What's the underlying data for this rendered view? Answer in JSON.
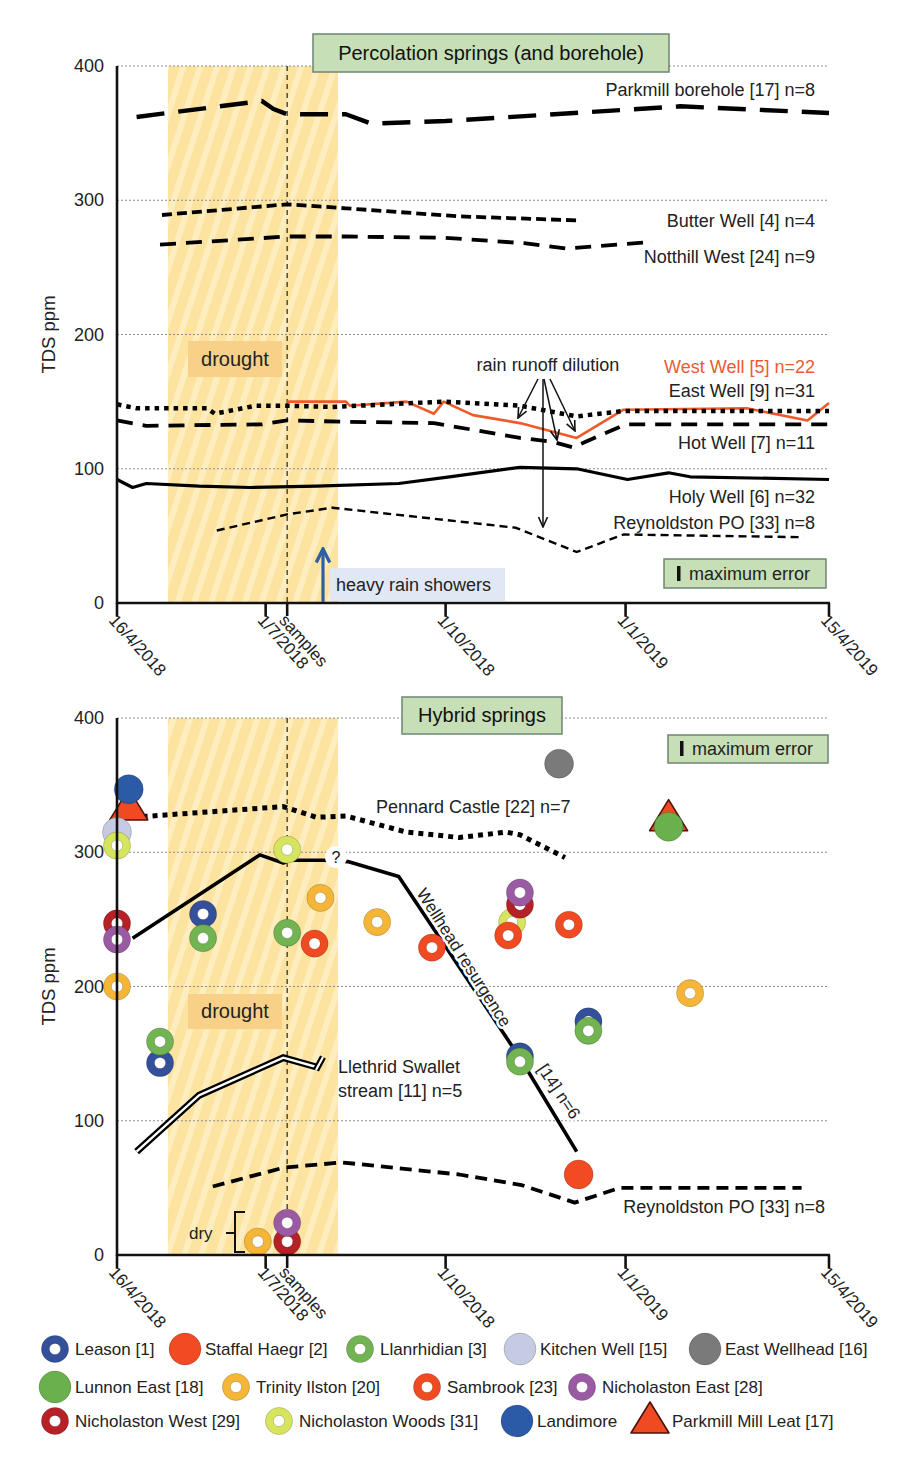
{
  "chart_data": [
    {
      "type": "line",
      "title": "Percolation springs (and borehole)",
      "xlabel": "",
      "ylabel": "TDS ppm",
      "ylim": [
        0,
        400
      ],
      "yticks": [
        0,
        100,
        200,
        300,
        400
      ],
      "xlim": [
        "2018-04-16",
        "2019-04-15"
      ],
      "xticks": [
        {
          "date": "2018-04-16",
          "label": "16/4/2018"
        },
        {
          "date": "2018-07-01",
          "label": "1/7/2018"
        },
        {
          "date": "2018-07-12",
          "label": "samples"
        },
        {
          "date": "2018-10-01",
          "label": "1/10/2018"
        },
        {
          "date": "2019-01-01",
          "label": "1/1/2019"
        },
        {
          "date": "2019-04-15",
          "label": "15/4/2019"
        }
      ],
      "grid": {
        "horizontal": true,
        "vertical": false,
        "style": "dotted"
      },
      "legend_position": "inline labels at right",
      "shaded_regions": [
        {
          "label": "drought",
          "from": "2018-05-12",
          "to": "2018-08-07",
          "color": "#fde4a0"
        }
      ],
      "vlines": [
        {
          "date": "2018-07-12",
          "label": "samples"
        }
      ],
      "series": [
        {
          "name": "Parkmill borehole [17] n=8",
          "style": "long-dash",
          "color": "#000000",
          "points": [
            [
              "2018-04-26",
              362
            ],
            [
              "2018-06-29",
              374
            ],
            [
              "2018-07-05",
              368
            ],
            [
              "2018-07-12",
              364
            ],
            [
              "2018-08-11",
              364
            ],
            [
              "2018-08-24",
              357
            ],
            [
              "2018-10-01",
              359
            ],
            [
              "2019-01-29",
              370
            ],
            [
              "2019-04-15",
              365
            ]
          ]
        },
        {
          "name": "Butter Well [4] n=4",
          "style": "short-dash",
          "color": "#000000",
          "points": [
            [
              "2018-05-09",
              289
            ],
            [
              "2018-07-12",
              297
            ],
            [
              "2018-08-11",
              294
            ],
            [
              "2018-10-08",
              288
            ],
            [
              "2018-12-08",
              285
            ]
          ]
        },
        {
          "name": "Notthill West [24] n=9",
          "style": "dash",
          "color": "#000000",
          "points": [
            [
              "2018-05-08",
              267
            ],
            [
              "2018-07-12",
              273
            ],
            [
              "2018-08-11",
              273
            ],
            [
              "2018-10-01",
              272
            ],
            [
              "2018-11-10",
              268
            ],
            [
              "2018-12-02",
              264
            ],
            [
              "2019-01-15",
              269
            ]
          ]
        },
        {
          "name": "West Well [5] n=22",
          "style": "solid-thin",
          "color": "#f05a28",
          "points": [
            [
              "2018-07-12",
              150
            ],
            [
              "2018-08-11",
              150
            ],
            [
              "2018-08-13",
              147
            ],
            [
              "2018-09-11",
              150
            ],
            [
              "2018-09-25",
              141
            ],
            [
              "2018-09-30",
              150
            ],
            [
              "2018-10-15",
              140
            ],
            [
              "2018-11-08",
              134
            ],
            [
              "2018-12-07",
              123
            ],
            [
              "2018-12-31",
              144
            ],
            [
              "2019-03-04",
              145
            ],
            [
              "2019-04-04",
              136
            ],
            [
              "2019-04-15",
              149
            ]
          ]
        },
        {
          "name": "East Well [9] n=31",
          "style": "dotted",
          "color": "#000000",
          "points": [
            [
              "2018-04-16",
              148
            ],
            [
              "2018-04-26",
              145
            ],
            [
              "2018-06-01",
              145
            ],
            [
              "2018-06-05",
              141
            ],
            [
              "2018-06-26",
              147
            ],
            [
              "2018-07-12",
              147
            ],
            [
              "2018-08-04",
              146
            ],
            [
              "2018-09-30",
              150
            ],
            [
              "2018-11-08",
              147
            ],
            [
              "2018-12-07",
              139
            ],
            [
              "2018-12-31",
              143
            ],
            [
              "2019-04-15",
              143
            ]
          ]
        },
        {
          "name": "Hot Well [7] n=11",
          "style": "dash",
          "color": "#000000",
          "points": [
            [
              "2018-04-16",
              136
            ],
            [
              "2018-05-01",
              132
            ],
            [
              "2018-06-29",
              133
            ],
            [
              "2018-07-12",
              136
            ],
            [
              "2018-08-13",
              135
            ],
            [
              "2018-09-25",
              134
            ],
            [
              "2018-11-08",
              123
            ],
            [
              "2018-11-25",
              120
            ],
            [
              "2018-12-05",
              116
            ],
            [
              "2019-01-01",
              133
            ],
            [
              "2019-04-15",
              133
            ]
          ]
        },
        {
          "name": "Holy Well [6] n=32",
          "style": "solid",
          "color": "#000000",
          "points": [
            [
              "2018-04-16",
              92
            ],
            [
              "2018-04-24",
              86
            ],
            [
              "2018-05-01",
              89
            ],
            [
              "2018-05-28",
              87
            ],
            [
              "2018-06-23",
              86
            ],
            [
              "2018-07-27",
              87
            ],
            [
              "2018-09-07",
              89
            ],
            [
              "2018-10-03",
              94
            ],
            [
              "2018-11-08",
              101
            ],
            [
              "2018-12-07",
              100
            ],
            [
              "2019-01-02",
              92
            ],
            [
              "2019-01-23",
              97
            ],
            [
              "2019-02-03",
              94
            ],
            [
              "2019-04-15",
              92
            ]
          ]
        },
        {
          "name": "Reynoldston PO [33] n=8",
          "style": "fine-dash",
          "color": "#000000",
          "points": [
            [
              "2018-06-06",
              54
            ],
            [
              "2018-07-12",
              66
            ],
            [
              "2018-08-04",
              71
            ],
            [
              "2018-09-30",
              62
            ],
            [
              "2018-11-06",
              56
            ],
            [
              "2018-12-07",
              38
            ],
            [
              "2018-12-31",
              51
            ],
            [
              "2019-04-02",
              49
            ]
          ]
        }
      ],
      "annotations": [
        {
          "text": "drought"
        },
        {
          "text": "rain runoff dilution",
          "arrow_count": 4
        },
        {
          "text": "heavy rain showers",
          "date": "2018-07-30",
          "color": "#2e5fa3"
        },
        {
          "text": "maximum error"
        }
      ]
    },
    {
      "type": "line+scatter",
      "title": "Hybrid springs",
      "xlabel": "",
      "ylabel": "TDS ppm",
      "ylim": [
        0,
        400
      ],
      "yticks": [
        0,
        100,
        200,
        300,
        400
      ],
      "xlim": [
        "2018-04-16",
        "2019-04-15"
      ],
      "xticks": [
        {
          "date": "2018-04-16",
          "label": "16/4/2018"
        },
        {
          "date": "2018-07-01",
          "label": "1/7/2018"
        },
        {
          "date": "2018-07-12",
          "label": "samples"
        },
        {
          "date": "2018-10-01",
          "label": "1/10/2018"
        },
        {
          "date": "2019-01-01",
          "label": "1/1/2019"
        },
        {
          "date": "2019-04-15",
          "label": "15/4/2019"
        }
      ],
      "grid": {
        "horizontal": true,
        "vertical": false,
        "style": "dotted"
      },
      "legend_position": "bottom",
      "shaded_regions": [
        {
          "label": "drought",
          "from": "2018-05-12",
          "to": "2018-08-07",
          "color": "#fde4a0"
        }
      ],
      "vlines": [
        {
          "date": "2018-07-12",
          "label": "samples"
        }
      ],
      "series": [
        {
          "name": "Pennard Castle [22] n=7",
          "style": "dotted-thick",
          "color": "#000000",
          "points": [
            [
              "2018-04-24",
              326
            ],
            [
              "2018-07-10",
              334
            ],
            [
              "2018-07-27",
              326
            ],
            [
              "2018-08-11",
              327
            ],
            [
              "2018-09-11",
              315
            ],
            [
              "2018-10-08",
              311
            ],
            [
              "2018-11-01",
              315
            ],
            [
              "2018-11-08",
              313
            ],
            [
              "2018-11-23",
              302
            ],
            [
              "2018-12-01",
              296
            ]
          ]
        },
        {
          "name": "Wellhead resurgence [14] n=6",
          "label_parts": [
            "Wellhead resurgence",
            "[14] n=6"
          ],
          "style": "solid-thick",
          "color": "#000000",
          "points": [
            [
              "2018-04-24",
              236
            ],
            [
              "2018-06-28",
              298
            ],
            [
              "2018-07-10",
              292
            ],
            [
              "2018-07-13",
              294
            ],
            [
              "2018-07-31",
              294
            ],
            [
              "2018-08-12",
              293
            ],
            [
              "2018-09-07",
              282
            ],
            [
              "2018-11-08",
              147
            ],
            [
              "2018-12-07",
              77
            ]
          ]
        },
        {
          "name": "Llethrid Swallet stream [11] n=5",
          "label_parts": [
            "Llethrid Swallet",
            "stream [11] n=5"
          ],
          "style": "double",
          "color": "#000000",
          "points": [
            [
              "2018-04-26",
              77
            ],
            [
              "2018-05-28",
              119
            ],
            [
              "2018-07-10",
              147
            ],
            [
              "2018-07-27",
              140
            ]
          ]
        },
        {
          "name": "Reynoldston PO [33] n=8",
          "style": "dash-med",
          "color": "#000000",
          "points": [
            [
              "2018-06-04",
              51
            ],
            [
              "2018-07-10",
              65
            ],
            [
              "2018-08-09",
              69
            ],
            [
              "2018-10-08",
              60
            ],
            [
              "2018-11-09",
              52
            ],
            [
              "2018-12-06",
              39
            ],
            [
              "2018-12-29",
              50
            ],
            [
              "2019-04-01",
              50
            ]
          ]
        }
      ],
      "scatter": [
        {
          "name": "Parkmill Mill Leat [17]",
          "marker": "triangle",
          "color": "#f04a23",
          "points": [
            [
              "2018-04-22",
              333
            ],
            [
              "2019-01-23",
              325
            ]
          ]
        },
        {
          "name": "Kitchen Well [15]",
          "marker": "filled",
          "color": "#c4cbe3",
          "points": [
            [
              "2018-04-16",
              315
            ]
          ]
        },
        {
          "name": "East Wellhead [16]",
          "marker": "filled",
          "color": "#7a7a7a",
          "points": [
            [
              "2018-11-28",
              366
            ]
          ]
        },
        {
          "name": "Landimore",
          "marker": "filled",
          "color": "#2b5aa7",
          "points": [
            [
              "2018-04-22",
              347
            ]
          ]
        },
        {
          "name": "Lunnon East [18]",
          "marker": "filled",
          "color": "#6ab04c",
          "points": [
            [
              "2019-01-23",
              319
            ]
          ]
        },
        {
          "name": "Staffal Haegr [2]",
          "marker": "filled",
          "color": "#f24b24",
          "points": [
            [
              "2018-12-08",
              60
            ]
          ]
        },
        {
          "name": "Trinity Ilston [20]",
          "marker": "ring",
          "color": "#f5b638",
          "points": [
            [
              "2018-04-16",
              200
            ],
            [
              "2018-07-29",
              266
            ],
            [
              "2018-08-27",
              248
            ],
            [
              "2019-02-03",
              195
            ],
            [
              "2018-06-27",
              10
            ]
          ]
        },
        {
          "name": "Nicholaston Woods [31]",
          "marker": "ring",
          "color": "#d6e45e",
          "points": [
            [
              "2018-04-16",
              305
            ],
            [
              "2018-07-12",
              302
            ],
            [
              "2018-11-04",
              248
            ]
          ]
        },
        {
          "name": "Sambrook [23]",
          "marker": "ring",
          "color": "#f04a23",
          "points": [
            [
              "2018-07-26",
              232
            ],
            [
              "2018-09-24",
              229
            ],
            [
              "2018-11-02",
              238
            ],
            [
              "2018-12-03",
              246
            ]
          ]
        },
        {
          "name": "Leason [1]",
          "marker": "ring",
          "color": "#34509a",
          "points": [
            [
              "2018-05-08",
              143
            ],
            [
              "2018-05-30",
              254
            ],
            [
              "2018-11-08",
              148
            ],
            [
              "2018-12-13",
              174
            ]
          ]
        },
        {
          "name": "Llanrhidian [3]",
          "marker": "ring",
          "color": "#72b352",
          "points": [
            [
              "2018-05-08",
              159
            ],
            [
              "2018-05-30",
              236
            ],
            [
              "2018-07-12",
              240
            ],
            [
              "2018-11-08",
              144
            ],
            [
              "2018-12-13",
              167
            ]
          ]
        },
        {
          "name": "Nicholaston West [29]",
          "marker": "ring",
          "color": "#b52126",
          "points": [
            [
              "2018-04-16",
              247
            ],
            [
              "2018-11-08",
              261
            ],
            [
              "2018-07-12",
              10
            ]
          ]
        },
        {
          "name": "Nicholaston East [28]",
          "marker": "ring",
          "color": "#9a5ba4",
          "points": [
            [
              "2018-04-16",
              235
            ],
            [
              "2018-11-08",
              270
            ],
            [
              "2018-07-12",
              24
            ]
          ]
        }
      ],
      "legend": {
        "items": [
          {
            "label": "Leason [1]",
            "marker": "ring",
            "color": "#34509a"
          },
          {
            "label": "Staffal Haegr [2]",
            "marker": "filled",
            "color": "#f24b24"
          },
          {
            "label": "Llanrhidian [3]",
            "marker": "ring",
            "color": "#72b352"
          },
          {
            "label": "Kitchen Well [15]",
            "marker": "filled",
            "color": "#c4cbe3"
          },
          {
            "label": "East Wellhead [16]",
            "marker": "filled",
            "color": "#7a7a7a"
          },
          {
            "label": "Lunnon East [18]",
            "marker": "filled",
            "color": "#6ab04c"
          },
          {
            "label": "Trinity Ilston [20]",
            "marker": "ring",
            "color": "#f5b638"
          },
          {
            "label": "Sambrook [23]",
            "marker": "ring",
            "color": "#f04a23"
          },
          {
            "label": "Nicholaston East [28]",
            "marker": "ring",
            "color": "#9a5ba4"
          },
          {
            "label": "Nicholaston West [29]",
            "marker": "ring",
            "color": "#b52126"
          },
          {
            "label": "Nicholaston Woods [31]",
            "marker": "ring",
            "color": "#d6e45e"
          },
          {
            "label": "Landimore",
            "marker": "filled",
            "color": "#2b5aa7"
          },
          {
            "label": "Parkmill Mill Leat [17]",
            "marker": "triangle",
            "color": "#f04a23"
          }
        ]
      },
      "annotations": [
        {
          "text": "drought"
        },
        {
          "text": "maximum error"
        },
        {
          "text": "?",
          "date": "2018-08-05",
          "value": 296
        },
        {
          "text": "dry"
        }
      ]
    }
  ]
}
